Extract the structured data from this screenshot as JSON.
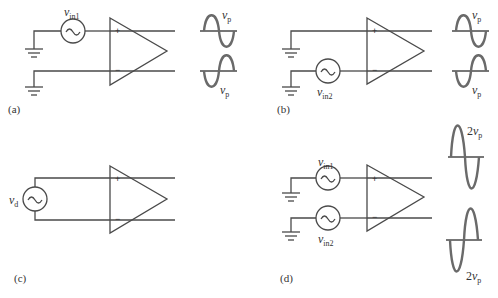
{
  "figure": {
    "panels": [
      {
        "id": "a",
        "label": "(a)",
        "sources": [
          {
            "name": "v",
            "sub": "in1",
            "input": "+"
          }
        ],
        "inputs": {
          "plus": "+",
          "minus": "−"
        },
        "waveforms": [
          {
            "label_main": "v",
            "label_sub": "p"
          },
          {
            "label_main": "v",
            "label_sub": "p"
          }
        ]
      },
      {
        "id": "b",
        "label": "(b)",
        "sources": [
          {
            "name": "v",
            "sub": "in2",
            "input": "−"
          }
        ],
        "inputs": {
          "plus": "+",
          "minus": "−"
        },
        "waveforms": [
          {
            "label_main": "v",
            "label_sub": "p"
          },
          {
            "label_main": "v",
            "label_sub": "p"
          }
        ]
      },
      {
        "id": "c",
        "label": "(c)",
        "sources": [
          {
            "name": "v",
            "sub": "d",
            "input": "differential"
          }
        ],
        "inputs": {
          "plus": "+",
          "minus": "−"
        }
      },
      {
        "id": "d",
        "label": "(d)",
        "sources": [
          {
            "name": "v",
            "sub": "in1",
            "input": "+"
          },
          {
            "name": "v",
            "sub": "in2",
            "input": "−"
          }
        ],
        "inputs": {
          "plus": "+",
          "minus": "−"
        },
        "waveforms": [
          {
            "label_coef": "2",
            "label_main": "v",
            "label_sub": "p"
          },
          {
            "label_coef": "2",
            "label_main": "v",
            "label_sub": "p"
          }
        ]
      }
    ]
  },
  "colors": {
    "wire": "#4a4a4a",
    "wave": "#6a6a6a",
    "text": "#333333"
  }
}
